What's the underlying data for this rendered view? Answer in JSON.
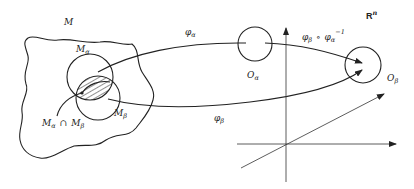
{
  "diagram": {
    "manifold_label": "M",
    "space_label": "R",
    "space_exponent": "n",
    "sets": {
      "m_alpha": {
        "base": "M",
        "sub": "α"
      },
      "m_beta": {
        "base": "M",
        "sub": "β"
      },
      "intersection": {
        "left": "M",
        "left_sub": "α",
        "op": "∩",
        "right": "M",
        "right_sub": "β"
      },
      "o_alpha": {
        "base": "O",
        "sub": "α"
      },
      "o_beta": {
        "base": "O",
        "sub": "β"
      }
    },
    "maps": {
      "phi_alpha": {
        "base": "φ",
        "sub": "α"
      },
      "phi_beta": {
        "base": "φ",
        "sub": "β"
      },
      "transition": {
        "left": "φ",
        "left_sub": "β",
        "op": "∘",
        "right": "φ",
        "right_sub": "α",
        "sup": "−1"
      }
    },
    "colors": {
      "ink": "#222222",
      "background": "#ffffff"
    }
  }
}
